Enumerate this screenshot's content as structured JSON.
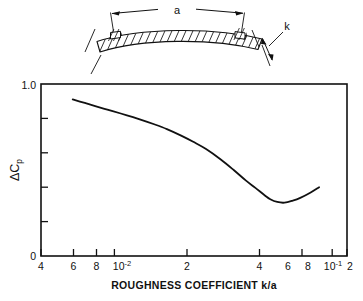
{
  "figure": {
    "kind": "technical-figure",
    "background": "#ffffff",
    "ink": "#111111"
  },
  "schematic": {
    "name": "curved-skin-cross-section",
    "labels": {
      "span": "a",
      "thickness": "k"
    },
    "description_parts": {
      "rib_left": "rib-left",
      "rib_right": "rib-right",
      "skin": "hatched-curved-skin",
      "span_dimension": "span-dimension-line",
      "thickness_dimension": "thickness-dimension-line"
    }
  },
  "chart_data": {
    "type": "line",
    "title": "",
    "xlabel": "ROUGHNESS COEFFICIENT k/a",
    "ylabel": "ΔCₚ",
    "ylabel_parts": {
      "delta": "Δ",
      "symbol": "C",
      "subscript": "p"
    },
    "xscale": "log",
    "yscale": "linear",
    "xlim": [
      0.004,
      0.2
    ],
    "ylim": [
      0,
      1.0
    ],
    "grid": false,
    "legend": null,
    "yticks": [
      0,
      0.2,
      0.4,
      0.6,
      0.8,
      1.0
    ],
    "ytick_labels": [
      "0",
      "",
      "",
      "",
      "",
      "1.0"
    ],
    "xticks": [
      0.004,
      0.006,
      0.008,
      0.01,
      0.02,
      0.04,
      0.06,
      0.08,
      0.1,
      0.2
    ],
    "xtick_labels": [
      "4",
      "6",
      "8",
      "10⁻²",
      "2",
      "4",
      "6",
      "8",
      "10⁻¹",
      "2"
    ],
    "xtick_label_plain": [
      "4",
      "6",
      "8",
      "10-2",
      "2",
      "4",
      "6",
      "8",
      "10-1",
      "2"
    ],
    "series": [
      {
        "name": "delta-Cp-vs-k-over-a",
        "x": [
          0.006,
          0.007,
          0.008,
          0.009,
          0.01,
          0.012,
          0.014,
          0.017,
          0.02,
          0.024,
          0.028,
          0.033,
          0.04,
          0.047,
          0.055,
          0.062,
          0.07,
          0.075,
          0.082,
          0.09,
          0.1,
          0.11,
          0.125,
          0.14
        ],
        "y": [
          0.91,
          0.89,
          0.872,
          0.856,
          0.842,
          0.818,
          0.796,
          0.766,
          0.738,
          0.7,
          0.664,
          0.622,
          0.56,
          0.5,
          0.438,
          0.396,
          0.352,
          0.33,
          0.314,
          0.31,
          0.322,
          0.338,
          0.368,
          0.4
        ]
      }
    ],
    "annotations": []
  }
}
